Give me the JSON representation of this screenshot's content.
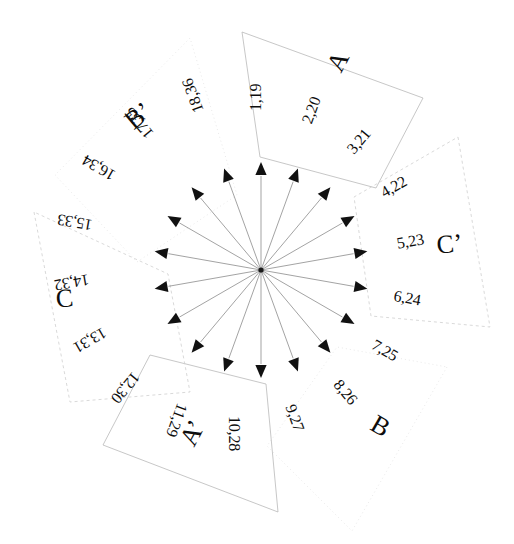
{
  "figure": {
    "center": {
      "x": 261,
      "y": 270
    },
    "ray_count": 18,
    "angle_step_deg": 20,
    "colors": {
      "ray": "#7b7b7b",
      "arrow": "#111111",
      "text": "#0d0d0d",
      "sector_solid": "#b9b9b9",
      "sector_dashed": "#cfcfcf",
      "sector_faint": "#e3e3e3",
      "background": "#ffffff"
    }
  },
  "chart_data": {
    "type": "scatter",
    "xlabel": "",
    "ylabel": "",
    "legend_position": "none",
    "grid": false,
    "center": {
      "x": 261,
      "y": 270
    },
    "rays": [
      {
        "id": 1,
        "label": "1,19",
        "angle_deg": 0,
        "arrow_r": 108,
        "label_r": 150,
        "text_rot": -90,
        "sector": "A"
      },
      {
        "id": 2,
        "label": "2,20",
        "angle_deg": 20,
        "arrow_r": 108,
        "label_r": 150,
        "text_rot": -70,
        "sector": "A"
      },
      {
        "id": 3,
        "label": "3,21",
        "angle_deg": 40,
        "arrow_r": 108,
        "label_r": 150,
        "text_rot": -50,
        "sector": "A"
      },
      {
        "id": 4,
        "label": "4,22",
        "angle_deg": 60,
        "arrow_r": 108,
        "label_r": 150,
        "text_rot": -30,
        "sector": "C'"
      },
      {
        "id": 5,
        "label": "5,23",
        "angle_deg": 80,
        "arrow_r": 108,
        "label_r": 150,
        "text_rot": -10,
        "sector": "C'"
      },
      {
        "id": 6,
        "label": "6,24",
        "angle_deg": 100,
        "arrow_r": 108,
        "label_r": 150,
        "text_rot": 10,
        "sector": "C'"
      },
      {
        "id": 7,
        "label": "7,25",
        "angle_deg": 120,
        "arrow_r": 108,
        "label_r": 150,
        "text_rot": 30,
        "sector": "B"
      },
      {
        "id": 8,
        "label": "8,26",
        "angle_deg": 140,
        "arrow_r": 108,
        "label_r": 150,
        "text_rot": 50,
        "sector": "B"
      },
      {
        "id": 9,
        "label": "9,27",
        "angle_deg": 160,
        "arrow_r": 108,
        "label_r": 150,
        "text_rot": 70,
        "sector": "B"
      },
      {
        "id": 10,
        "label": "10,28",
        "angle_deg": 180,
        "arrow_r": 108,
        "label_r": 155,
        "text_rot": 90,
        "sector": "A'"
      },
      {
        "id": 11,
        "label": "11,29",
        "angle_deg": 200,
        "arrow_r": 108,
        "label_r": 155,
        "text_rot": 110,
        "sector": "A'"
      },
      {
        "id": 12,
        "label": "12,30",
        "angle_deg": 220,
        "arrow_r": 108,
        "label_r": 155,
        "text_rot": 130,
        "sector": "A'"
      },
      {
        "id": 13,
        "label": "13,31",
        "angle_deg": 240,
        "arrow_r": 108,
        "label_r": 155,
        "text_rot": 150,
        "sector": "C"
      },
      {
        "id": 14,
        "label": "14,32",
        "angle_deg": 260,
        "arrow_r": 108,
        "label_r": 155,
        "text_rot": 170,
        "sector": "C"
      },
      {
        "id": 15,
        "label": "15,33",
        "angle_deg": 280,
        "arrow_r": 108,
        "label_r": 155,
        "text_rot": 190,
        "sector": "C"
      },
      {
        "id": 16,
        "label": "16,34",
        "angle_deg": 300,
        "arrow_r": 108,
        "label_r": 155,
        "text_rot": 210,
        "sector": "B'"
      },
      {
        "id": 17,
        "label": "17,35",
        "angle_deg": 320,
        "arrow_r": 108,
        "label_r": 155,
        "text_rot": 230,
        "sector": "B'"
      },
      {
        "id": 18,
        "label": "18,36",
        "angle_deg": 340,
        "arrow_r": 108,
        "label_r": 155,
        "text_rot": 250,
        "sector": "B'"
      }
    ],
    "sectors": [
      {
        "name": "A",
        "label": "A",
        "rays": [
          1,
          2,
          3
        ],
        "style": "solid",
        "points": "242,32 423,98 376,188 260,157",
        "label_pos": {
          "x": 330,
          "y": 78
        },
        "label_rot": -62
      },
      {
        "name": "C'",
        "label": "C’",
        "rays": [
          4,
          5,
          6
        ],
        "style": "dashed",
        "points": "458,137 490,327 371,316 354,197",
        "label_pos": {
          "x": 448,
          "y": 246
        },
        "label_rot": -6
      },
      {
        "name": "B",
        "label": "B",
        "rays": [
          7,
          8,
          9
        ],
        "style": "faint",
        "points": "447,367 352,531 267,446 337,347",
        "label_pos": {
          "x": 389,
          "y": 424
        },
        "label_rot": 30
      },
      {
        "name": "A'",
        "label": "A’",
        "rays": [
          10,
          11,
          12
        ],
        "style": "solid",
        "points": "278,512 103,445 150,355 266,384",
        "label_pos": {
          "x": 186,
          "y": 452
        },
        "label_rot": -62
      },
      {
        "name": "C",
        "label": "C",
        "rays": [
          13,
          14,
          15
        ],
        "style": "dashed",
        "points": "34,212 70,402 190,392 168,274",
        "label_pos": {
          "x": 63,
          "y": 300
        },
        "label_rot": -6
      },
      {
        "name": "B'",
        "label": "B’",
        "rays": [
          16,
          17,
          18
        ],
        "style": "faint",
        "points": "190,38 55,175 137,262 237,195",
        "label_pos": {
          "x": 132,
          "y": 128
        },
        "label_rot": -40
      }
    ]
  }
}
